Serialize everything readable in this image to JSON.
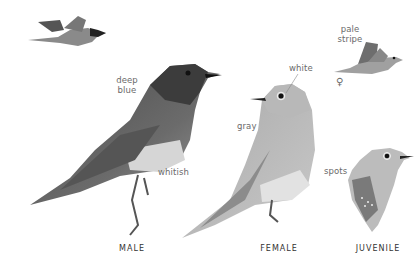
{
  "plate": {
    "subjects": [
      {
        "id": "male",
        "caption": "MALE",
        "labels": {
          "head": "deep blue",
          "belly": "whitish"
        }
      },
      {
        "id": "female",
        "caption": "FEMALE",
        "labels": {
          "eye": "white",
          "body": "gray"
        }
      },
      {
        "id": "juvenile",
        "caption": "JUVENILE",
        "labels": {
          "breast": "spots"
        }
      }
    ],
    "flight_female": {
      "label_line1": "pale",
      "label_line2": "stripe",
      "symbol": "♀"
    },
    "annotations": {
      "deep_line1": "deep",
      "deep_line2": "blue",
      "whitish": "whitish",
      "white": "white",
      "gray": "gray",
      "spots": "spots"
    }
  }
}
